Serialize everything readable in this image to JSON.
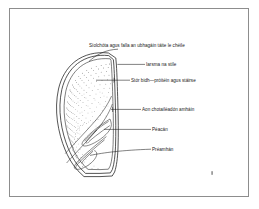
{
  "figure": {
    "language": "Irish",
    "frame": {
      "visible": true,
      "color": "#8d8d8d"
    },
    "background_color": "#ffffff",
    "ink_color": "#1a1a1a"
  },
  "labels": [
    {
      "id": "testa-fused",
      "text": "Síolchóta agus falla an ubhagáin táite le chéile",
      "x": 89,
      "y": 47,
      "anchor": "start"
    },
    {
      "id": "style-remnant",
      "text": "Iarsma na stíle",
      "x": 146,
      "y": 66,
      "anchor": "start"
    },
    {
      "id": "food-store",
      "text": "Stór bidh—próitéin agus stáirse",
      "x": 131,
      "y": 82,
      "anchor": "start"
    },
    {
      "id": "single-cotyledon",
      "text": "Aon chotailéadón amháin",
      "x": 142,
      "y": 111,
      "anchor": "start"
    },
    {
      "id": "plumule",
      "text": "Péacán",
      "x": 152,
      "y": 131,
      "anchor": "start"
    },
    {
      "id": "radicle",
      "text": "Préamhán",
      "x": 152,
      "y": 151,
      "anchor": "start"
    }
  ],
  "parts": {
    "seed_coat": "Síolchóta agus falla an ubhagáin táite le chéile",
    "style_remnant": "Iarsma na stíle",
    "endosperm": "Stór bidh—próitéin agus stáirse",
    "cotyledon": "Aon chotailéadón amháin",
    "plumule": "Péacán",
    "radicle": "Préamhán"
  },
  "marks": {
    "corner_speck": {
      "x": 212,
      "y": 173
    }
  }
}
